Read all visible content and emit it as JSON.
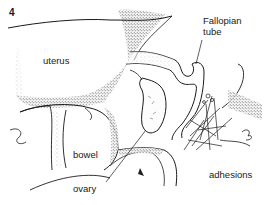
{
  "figure": {
    "number": "4",
    "labels": {
      "uterus": "uterus",
      "fallopian_tube_line1": "Fallopian",
      "fallopian_tube_line2": "tube",
      "bowel": "bowel",
      "ovary": "ovary",
      "adhesions": "adhesions"
    },
    "colors": {
      "ink": "#1a1a1a",
      "background": "#ffffff",
      "stipple": "#555555"
    }
  }
}
